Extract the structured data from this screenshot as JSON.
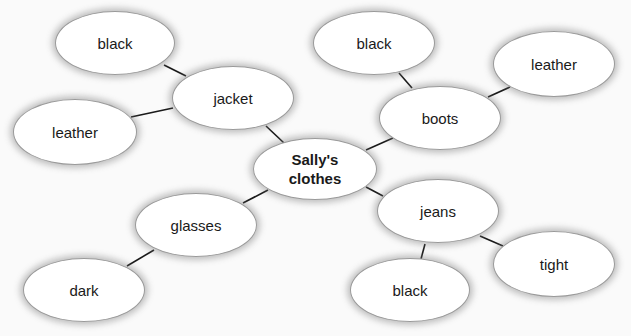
{
  "diagram": {
    "type": "mind-map",
    "center": {
      "id": "center",
      "label": "Sally's\nclothes",
      "cx": 315,
      "cy": 169,
      "rx": 62,
      "ry": 31
    },
    "nodes": [
      {
        "id": "jacket",
        "label": "jacket",
        "cx": 233,
        "cy": 98,
        "rx": 61,
        "ry": 32,
        "parent": "center"
      },
      {
        "id": "jacket-black",
        "label": "black",
        "cx": 115,
        "cy": 43,
        "rx": 60,
        "ry": 32,
        "parent": "jacket"
      },
      {
        "id": "jacket-leather",
        "label": "leather",
        "cx": 75,
        "cy": 132,
        "rx": 62,
        "ry": 33,
        "parent": "jacket"
      },
      {
        "id": "boots",
        "label": "boots",
        "cx": 440,
        "cy": 118,
        "rx": 61,
        "ry": 32,
        "parent": "center"
      },
      {
        "id": "boots-black",
        "label": "black",
        "cx": 374,
        "cy": 43,
        "rx": 61,
        "ry": 32,
        "parent": "boots"
      },
      {
        "id": "boots-leather",
        "label": "leather",
        "cx": 554,
        "cy": 64,
        "rx": 61,
        "ry": 33,
        "parent": "boots"
      },
      {
        "id": "glasses",
        "label": "glasses",
        "cx": 196,
        "cy": 225,
        "rx": 61,
        "ry": 32,
        "parent": "center"
      },
      {
        "id": "glasses-dark",
        "label": "dark",
        "cx": 84,
        "cy": 290,
        "rx": 61,
        "ry": 32,
        "parent": "glasses"
      },
      {
        "id": "jeans",
        "label": "jeans",
        "cx": 438,
        "cy": 211,
        "rx": 61,
        "ry": 32,
        "parent": "center"
      },
      {
        "id": "jeans-black",
        "label": "black",
        "cx": 410,
        "cy": 290,
        "rx": 60,
        "ry": 32,
        "parent": "jeans"
      },
      {
        "id": "jeans-tight",
        "label": "tight",
        "cx": 554,
        "cy": 264,
        "rx": 61,
        "ry": 33,
        "parent": "jeans"
      }
    ],
    "links": [
      {
        "from": "center",
        "to": "jacket",
        "x1": 284,
        "y1": 143,
        "x2": 266,
        "y2": 126
      },
      {
        "from": "jacket",
        "to": "jacket-black",
        "x1": 186,
        "y1": 76,
        "x2": 164,
        "y2": 65
      },
      {
        "from": "jacket",
        "to": "jacket-leather",
        "x1": 173,
        "y1": 108,
        "x2": 131,
        "y2": 117
      },
      {
        "from": "center",
        "to": "boots",
        "x1": 366,
        "y1": 150,
        "x2": 393,
        "y2": 138
      },
      {
        "from": "boots",
        "to": "boots-black",
        "x1": 412,
        "y1": 88,
        "x2": 399,
        "y2": 73
      },
      {
        "from": "boots",
        "to": "boots-leather",
        "x1": 488,
        "y1": 97,
        "x2": 510,
        "y2": 87
      },
      {
        "from": "center",
        "to": "glasses",
        "x1": 268,
        "y1": 190,
        "x2": 243,
        "y2": 203
      },
      {
        "from": "glasses",
        "to": "glasses-dark",
        "x1": 154,
        "y1": 250,
        "x2": 127,
        "y2": 266
      },
      {
        "from": "center",
        "to": "jeans",
        "x1": 366,
        "y1": 187,
        "x2": 383,
        "y2": 196
      },
      {
        "from": "jeans",
        "to": "jeans-black",
        "x1": 425,
        "y1": 244,
        "x2": 421,
        "y2": 259
      },
      {
        "from": "jeans",
        "to": "jeans-tight",
        "x1": 480,
        "y1": 236,
        "x2": 503,
        "y2": 246
      }
    ]
  },
  "colors": {
    "background": "#fafafa",
    "node_fill": "#ffffff",
    "node_border": "#9a9a9a",
    "line": "#1a1a1a",
    "text": "#1a1a1a"
  }
}
